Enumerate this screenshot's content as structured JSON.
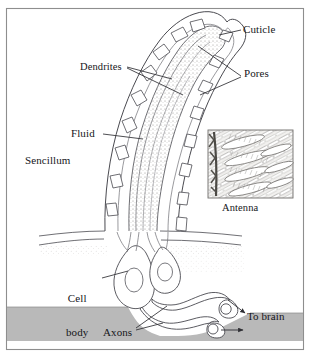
{
  "figure": {
    "frame_color": "#8e8e8e",
    "background": "#ffffff",
    "ink_color": "#3d3d42",
    "band_color": "#b9b9b9",
    "fluid_color": "#c9c7c4"
  },
  "labels": {
    "cuticle": "Cuticle",
    "dendrites": "Dendrites",
    "pores": "Pores",
    "fluid": "Fluid",
    "sencillum": "Sencillum",
    "antenna": "Antenna",
    "cell_body_line1": "Cell",
    "cell_body_line2": "body",
    "axons": "Axons",
    "to_brain": "To brain"
  },
  "inset": {
    "caption": "Antenna",
    "description": "micrograph of antenna branch with diagonal sensilla hairs"
  }
}
